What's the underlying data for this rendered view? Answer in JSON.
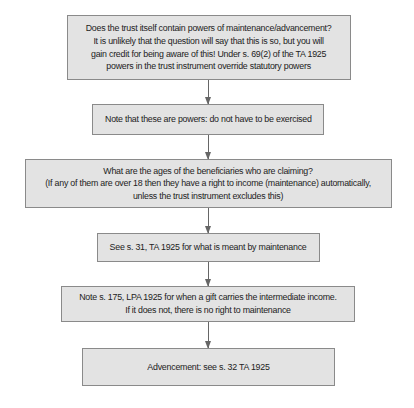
{
  "diagram": {
    "type": "flowchart",
    "direction": "top-to-bottom",
    "colors": {
      "box_fill": "#e3e3e3",
      "box_border": "#8a8a8a",
      "text": "#222222",
      "arrow": "#666666",
      "background": "#ffffff"
    },
    "nodes": [
      {
        "id": "n1",
        "lines": [
          "Does the trust itself contain powers of maintenance/advancement?",
          "It is unlikely that the question will say that this is so, but you will",
          "gain credit for being aware of this! Under s. 69(2) of the TA 1925",
          "powers in the trust instrument override statutory powers"
        ]
      },
      {
        "id": "n2",
        "lines": [
          "Note that these are powers: do not have to be exercised"
        ]
      },
      {
        "id": "n3",
        "lines": [
          "What are the ages of the beneficiaries who are claiming?",
          "(If any of them are over 18 then they have a right to income (maintenance) automatically,",
          "unless the trust instrument excludes this)"
        ]
      },
      {
        "id": "n4",
        "lines": [
          "See s. 31, TA 1925 for what is meant by maintenance"
        ]
      },
      {
        "id": "n5",
        "lines": [
          "Note s. 175, LPA 1925 for when a gift carries the intermediate income.",
          "If it does not, there is no right to maintenance"
        ]
      },
      {
        "id": "n6",
        "lines": [
          "Advencement: see s. 32 TA 1925"
        ]
      }
    ],
    "edges": [
      {
        "from": "n1",
        "to": "n2"
      },
      {
        "from": "n2",
        "to": "n3"
      },
      {
        "from": "n3",
        "to": "n4"
      },
      {
        "from": "n4",
        "to": "n5"
      },
      {
        "from": "n5",
        "to": "n6"
      }
    ]
  }
}
